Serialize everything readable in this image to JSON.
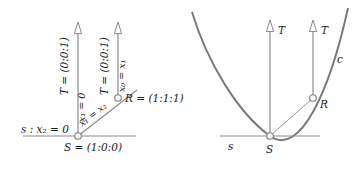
{
  "figure": {
    "stroke_color": "#8a8a8a",
    "curve_color": "#777777",
    "text_color": "#1a1a1a",
    "background": "#ffffff",
    "left_panel": {
      "name": "linear-model",
      "labels": {
        "tangent_left": "T = (0:0:1)",
        "tangent_right": "T = (0:0:1)",
        "vertical_left_line": "x₁ = 0",
        "vertical_right_line": "x₀ = x₁",
        "diagonal_line": "x₁ = x₂",
        "point_r": "R = (1:1:1)",
        "point_s": "S = (1:0:0)",
        "line_s": "s : x₂ = 0"
      },
      "points": {
        "S": "(1:0:0)",
        "R": "(1:1:1)",
        "T": "(0:0:1)"
      }
    },
    "right_panel": {
      "name": "conic-model",
      "labels": {
        "tangent_left": "T",
        "tangent_right": "T",
        "curve": "c",
        "point_r": "R",
        "point_s": "S",
        "line_s": "s"
      }
    }
  }
}
